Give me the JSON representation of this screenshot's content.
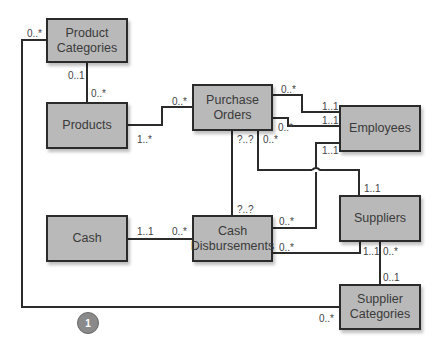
{
  "entities": {
    "product_categories": "Product\nCategories",
    "products": "Products",
    "purchase_orders": "Purchase\nOrders",
    "employees": "Employees",
    "cash": "Cash",
    "cash_disbursements": "Cash\nDisbursements",
    "suppliers": "Suppliers",
    "supplier_categories": "Supplier\nCategories"
  },
  "multiplicities": {
    "pc_left": "0..*",
    "pc_products_top": "0..1",
    "pc_products_bottom": "0..*",
    "products_po_left": "1..*",
    "products_po_right": "0..*",
    "po_emp_top_po": "0..*",
    "po_emp_top_emp": "1..1",
    "po_emp_mid_po": "0..*",
    "po_emp_mid_emp": "1..1",
    "po_cd_po": "?..?",
    "po_sup_po": "0..*",
    "cd_emp_emp": "1..1",
    "cd_po": "?..?",
    "cd_emp_cd": "0..*",
    "sup_po_sup": "1..1",
    "cash_cd_cash": "1..1",
    "cash_cd_cd": "0..*",
    "cd_sup_cd": "0..*",
    "cd_sup_sup": "1..1",
    "sup_sc_sup": "0..*",
    "sup_sc_sc": "0..1",
    "sc_left": "0..*"
  },
  "badge": "1",
  "colors": {
    "entity_fill": "#b9b9b9",
    "line": "#2b2b2b",
    "badge": "#8a8a8a"
  }
}
